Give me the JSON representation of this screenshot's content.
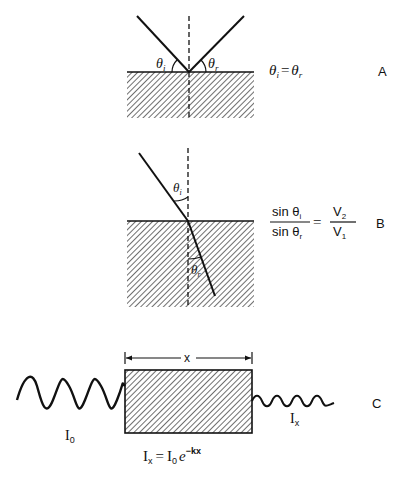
{
  "panels": [
    {
      "id": "A",
      "label": "A",
      "title": "Reflection",
      "angle_labels": {
        "incident": "θ",
        "incident_sub": "i",
        "reflected": "θ",
        "reflected_sub": "r"
      },
      "equation": {
        "lhs": "θ",
        "lhs_sub": "i",
        "eq": "=",
        "rhs": "θ",
        "rhs_sub": "r"
      }
    },
    {
      "id": "B",
      "label": "B",
      "title": "Refraction",
      "angle_labels": {
        "incident": "θ",
        "incident_sub": "i",
        "refracted": "θ",
        "refracted_sub": "r"
      },
      "equation": {
        "num": "sin θ",
        "num_sub": "i",
        "den": "sin θ",
        "den_sub": "r",
        "eq": "=",
        "rnum": "V",
        "rnum_sub": "2",
        "rden": "V",
        "rden_sub": "1"
      }
    },
    {
      "id": "C",
      "label": "C",
      "title": "Attenuation",
      "thickness_label": "x",
      "input_label": "I",
      "input_sub": "0",
      "output_label": "I",
      "output_sub": "x",
      "equation": {
        "lhs": "I",
        "lhs_sub": "x",
        "eq": "=",
        "rhs": "I",
        "rhs_sub": "0",
        "base": "e",
        "exp": "−kx"
      }
    }
  ],
  "colors": {
    "ink": "#111111",
    "background": "#ffffff"
  }
}
